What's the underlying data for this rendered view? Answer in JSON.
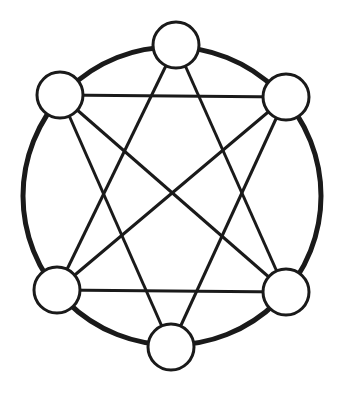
{
  "diagram": {
    "type": "graph",
    "background": "#ffffff",
    "stroke_color": "#1a1a1a",
    "outer_ring": {
      "cx": 172,
      "cy": 196,
      "rx": 149,
      "ry": 149,
      "stroke_width": 5
    },
    "nodes": [
      {
        "id": "top",
        "cx": 176,
        "cy": 45,
        "r": 23
      },
      {
        "id": "top-left",
        "cx": 60,
        "cy": 95,
        "r": 23
      },
      {
        "id": "top-right",
        "cx": 286,
        "cy": 97,
        "r": 23
      },
      {
        "id": "bottom-left",
        "cx": 57,
        "cy": 290,
        "r": 23
      },
      {
        "id": "bottom-right",
        "cx": 286,
        "cy": 292,
        "r": 23
      },
      {
        "id": "bottom",
        "cx": 171,
        "cy": 347,
        "r": 23
      }
    ],
    "edges": [
      [
        "top-left",
        "top-right"
      ],
      [
        "bottom-left",
        "bottom-right"
      ],
      [
        "top",
        "bottom-left"
      ],
      [
        "top",
        "bottom-right"
      ],
      [
        "top-left",
        "bottom-right"
      ],
      [
        "top-left",
        "bottom"
      ],
      [
        "top-right",
        "bottom-left"
      ],
      [
        "top-right",
        "bottom"
      ]
    ]
  }
}
